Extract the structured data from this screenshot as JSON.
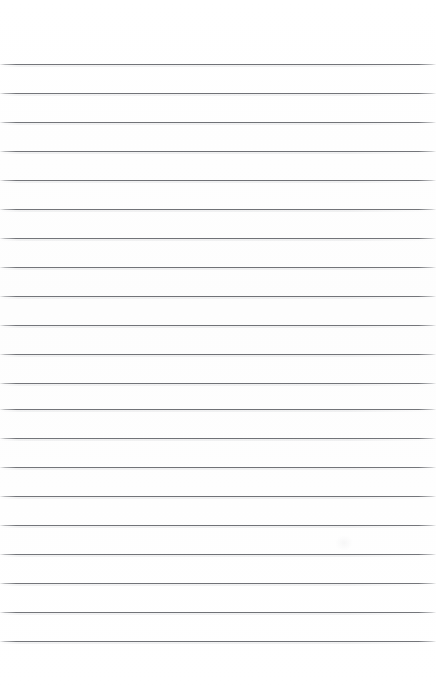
{
  "page": {
    "width": 436,
    "height": 687,
    "background_color": "#fefefe",
    "content_text": ""
  },
  "ruling": {
    "line_color": "#686a6f",
    "line_thickness_px": 1,
    "line_spacing_px": 29,
    "first_line_y_px": 64,
    "last_line_y_px": 641,
    "line_count": 21,
    "top_margin_px": 64,
    "bottom_margin_px": 46,
    "left_inset_px": 0,
    "right_inset_px": 0,
    "margin_rule": "none",
    "line_y_positions": [
      64,
      93,
      122,
      151,
      180,
      209,
      238,
      267,
      296,
      325,
      354,
      383,
      409,
      438,
      467,
      496,
      525,
      554,
      583,
      612,
      641
    ]
  },
  "artifacts": {
    "smudge": {
      "label": "faint-scan-smudge",
      "x_px": 336,
      "y_px": 536,
      "opacity": 0.3
    }
  }
}
